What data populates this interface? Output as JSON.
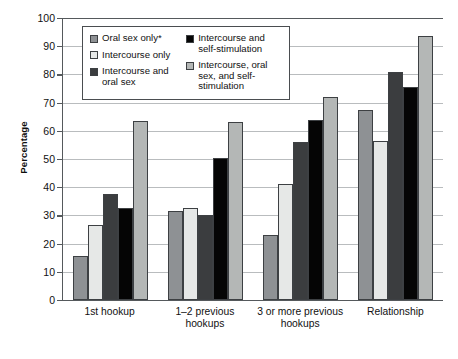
{
  "chart_data": {
    "type": "bar",
    "title": "",
    "xlabel": "",
    "ylabel": "Percentage",
    "ylim": [
      0,
      100
    ],
    "ytick_step": 10,
    "yticks": [
      100,
      90,
      80,
      70,
      60,
      50,
      40,
      30,
      20,
      10,
      0
    ],
    "grid": true,
    "legend_position": "upper-left inside plot",
    "categories": [
      "1st hookup",
      "1–2 previous hookups",
      "3 or more previous hookups",
      "Relationship"
    ],
    "series": [
      {
        "name": "Oral sex only*",
        "color": "#8e9194",
        "values": [
          15.5,
          31.5,
          23,
          67.5
        ]
      },
      {
        "name": "Intercourse only",
        "color": "#e6e8e7",
        "values": [
          26.5,
          32.5,
          41,
          56.5
        ]
      },
      {
        "name": "Intercourse and oral sex",
        "color": "#3b3d3f",
        "values": [
          37.5,
          30,
          56,
          81
        ]
      },
      {
        "name": "Intercourse and self-stimulation",
        "color": "#050505",
        "values": [
          32.5,
          50.5,
          64,
          75.5
        ]
      },
      {
        "name": "Intercourse, oral sex, and self-stimulation",
        "color": "#b4b7b6",
        "values": [
          63.5,
          63,
          72,
          93.5
        ]
      }
    ]
  },
  "legend": {
    "items": [
      {
        "label": "Oral sex only*"
      },
      {
        "label": "Intercourse only"
      },
      {
        "label": "Intercourse and oral sex"
      },
      {
        "label": "Intercourse and self-stimulation"
      },
      {
        "label": "Intercourse, oral sex, and self-stimulation"
      }
    ]
  }
}
